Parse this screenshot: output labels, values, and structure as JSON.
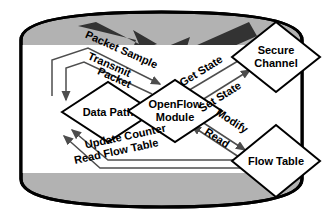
{
  "figure": {
    "type": "diagram",
    "subtype": "openflow-switch-architecture",
    "nodes": [
      {
        "id": "data_path",
        "label_lines": [
          "Data Path"
        ],
        "shape": "diamond"
      },
      {
        "id": "openflow",
        "label_lines": [
          "OpenFlow",
          "Module"
        ],
        "shape": "diamond"
      },
      {
        "id": "secure_channel",
        "label_lines": [
          "Secure",
          "Channel"
        ],
        "shape": "diamond"
      },
      {
        "id": "flow_table",
        "label_lines": [
          "Flow Table"
        ],
        "shape": "diamond"
      }
    ],
    "edges": [
      {
        "id": "packet_sample",
        "label": "Packet Sample",
        "from": "data_path",
        "to": "openflow"
      },
      {
        "id": "transmit_packet",
        "label": "Transmit Packet",
        "from": "openflow",
        "to": "data_path"
      },
      {
        "id": "get_state",
        "label": "Get State",
        "from": "secure_channel",
        "to": "openflow"
      },
      {
        "id": "set_state",
        "label": "Set State",
        "from": "openflow",
        "to": "secure_channel"
      },
      {
        "id": "modify",
        "label": "Modify",
        "from": "openflow",
        "to": "flow_table"
      },
      {
        "id": "read",
        "label": "Read",
        "from": "flow_table",
        "to": "openflow"
      },
      {
        "id": "update_counter",
        "label": "Update Counter",
        "from": "flow_table",
        "to": "data_path"
      },
      {
        "id": "read_flow_table",
        "label": "Read Flow Table",
        "from": "flow_table",
        "to": "data_path"
      }
    ],
    "edge_label_lines": {
      "transmit_packet": [
        "Transmit",
        "Packet"
      ]
    },
    "colors": {
      "outline": "#000000",
      "shell_fill": "#b2b2b2",
      "panel_fill": "#ffffff",
      "node_fill": "#ffffff",
      "arrow": "#4d4d4d",
      "big_arrow": "#333333",
      "text": "#000000"
    },
    "background_arrow": {
      "name": "chevron-double-arrow",
      "heads": 2
    }
  }
}
